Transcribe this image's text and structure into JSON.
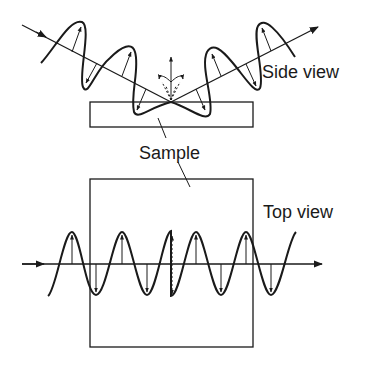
{
  "labels": {
    "side_view": "Side view",
    "sample": "Sample",
    "top_view": "Top view"
  },
  "colors": {
    "ink": "#1a1a1a",
    "background": "#ffffff"
  },
  "diagram": {
    "icons": [
      "incident-beam-arrow",
      "reflected-beam-arrow",
      "polarization-vector-arrow",
      "surface-normal-arrow"
    ]
  }
}
